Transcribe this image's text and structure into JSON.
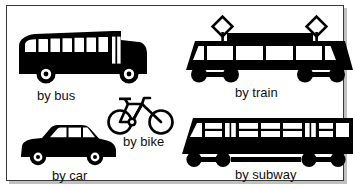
{
  "poster": {
    "background_color": "#ffffff",
    "border_color": "#3a3a3a",
    "ink_color": "#000000",
    "text_color": "#111111"
  },
  "items": [
    {
      "id": "bus",
      "icon": "bus-icon",
      "label": "by bus"
    },
    {
      "id": "train",
      "icon": "train-icon",
      "label": "by train"
    },
    {
      "id": "bike",
      "icon": "bicycle-icon",
      "label": "by bike"
    },
    {
      "id": "car",
      "icon": "car-icon",
      "label": "by car"
    },
    {
      "id": "subway",
      "icon": "subway-icon",
      "label": "by subway"
    }
  ]
}
